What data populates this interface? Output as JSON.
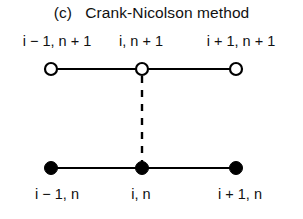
{
  "figure": {
    "title": "(c)   Crank-Nicolson method",
    "part_label": "(c)",
    "method_name": "Crank-Nicolson method",
    "background_color": "#ffffff",
    "line_color": "#000000",
    "text_color": "#111111"
  },
  "stencil": {
    "top_row": {
      "time_level": "n+1",
      "node_style": "open-circle",
      "node_fill": "#ffffff",
      "node_stroke": "#000000",
      "labels": [
        {
          "id": "top-left",
          "text": "i − 1, n + 1",
          "i_symbol": "i",
          "rest": " − 1, n + 1",
          "center_x": 57,
          "node_x": 51,
          "node_y": 69
        },
        {
          "id": "top-center",
          "text": "i, n + 1",
          "i_symbol": "i",
          "rest": ", n + 1",
          "center_x": 141,
          "node_x": 142,
          "node_y": 69
        },
        {
          "id": "top-right",
          "text": "i + 1, n + 1",
          "i_symbol": "i",
          "rest": " + 1, n + 1",
          "center_x": 241,
          "node_x": 236,
          "node_y": 69
        }
      ]
    },
    "bottom_row": {
      "time_level": "n",
      "node_style": "filled-circle",
      "node_fill": "#000000",
      "node_stroke": "#000000",
      "labels": [
        {
          "id": "bottom-left",
          "text": "i − 1, n",
          "i_symbol": "i",
          "rest": " − 1, n",
          "center_x": 57,
          "node_x": 51,
          "node_y": 168
        },
        {
          "id": "bottom-center",
          "text": "i, n",
          "i_symbol": "i",
          "rest": ", n",
          "center_x": 141,
          "node_x": 142,
          "node_y": 168
        },
        {
          "id": "bottom-right",
          "text": "i + 1, n",
          "i_symbol": "i",
          "rest": " + 1, n",
          "center_x": 240,
          "node_x": 236,
          "node_y": 168
        }
      ]
    },
    "connector": {
      "style": "dashed",
      "orientation": "vertical",
      "from_x": 142,
      "from_y": 76,
      "to_x": 142,
      "to_y": 162,
      "dash_length": 7,
      "gap_length": 7
    }
  }
}
